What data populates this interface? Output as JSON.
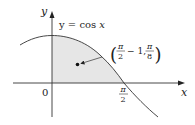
{
  "figure": {
    "curve_label": "y = cos x",
    "curve_label_prefix": "y = cos ",
    "curve_label_var": "x",
    "axis_x_label": "x",
    "axis_y_label": "y",
    "origin_label": "0",
    "tick_pi_over_2": {
      "num": "π",
      "den": "2"
    },
    "centroid_label": {
      "x_num": "π",
      "x_den": "2",
      "x_rest": "− 1,",
      "y_num": "π",
      "y_den": "8"
    },
    "colors": {
      "region_fill": "#e6e6e6",
      "stroke": "#333333",
      "background": "#ffffff"
    }
  }
}
